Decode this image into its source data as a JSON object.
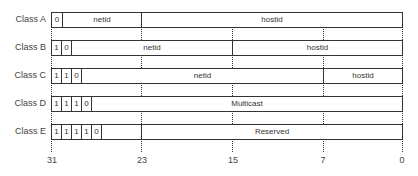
{
  "diagram": {
    "classes": [
      {
        "label": "Class A",
        "bits": [
          "0"
        ],
        "fields": [
          "netid",
          "hostid"
        ]
      },
      {
        "label": "Class B",
        "bits": [
          "1",
          "0"
        ],
        "fields": [
          "netid",
          "hostid"
        ]
      },
      {
        "label": "Class C",
        "bits": [
          "1",
          "1",
          "0"
        ],
        "fields": [
          "netid",
          "hostid"
        ]
      },
      {
        "label": "Class D",
        "bits": [
          "1",
          "1",
          "1",
          "0"
        ],
        "fields": [
          "Multicast"
        ]
      },
      {
        "label": "Class E",
        "bits": [
          "1",
          "1",
          "1",
          "1",
          "0"
        ],
        "fields": [
          "Reserved"
        ]
      }
    ],
    "bit_ticks": [
      "31",
      "23",
      "15",
      "7",
      "0"
    ]
  }
}
